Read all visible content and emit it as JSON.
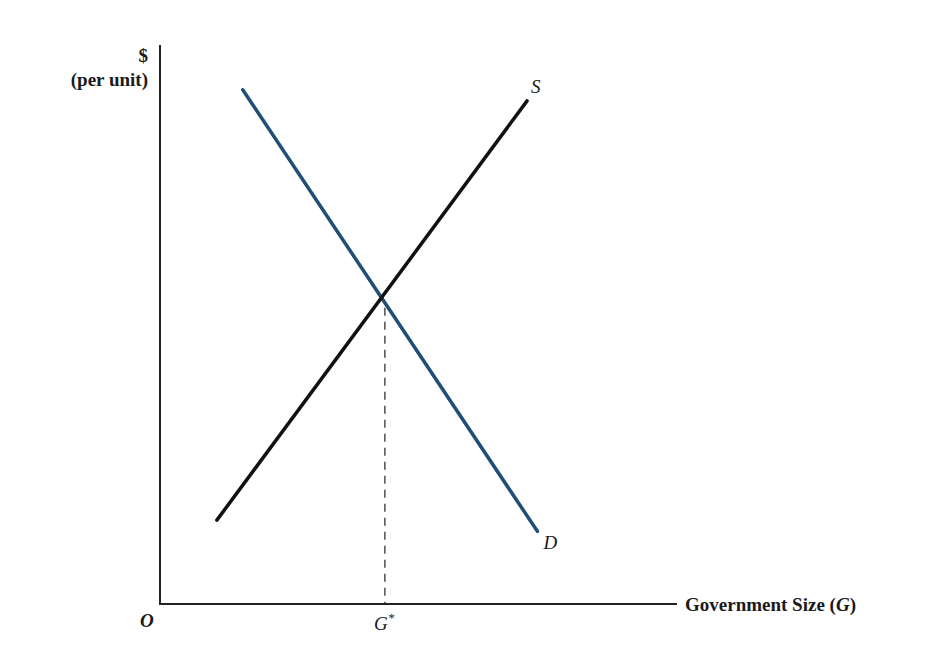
{
  "chart_data": {
    "type": "line",
    "title": "",
    "ylabel_line1": "$",
    "ylabel_line2": "(per unit)",
    "xlabel_prefix": "Government Size (",
    "xlabel_var": "G",
    "xlabel_suffix": ")",
    "origin_label": "O",
    "equilibrium_label": "G",
    "equilibrium_sup": "*",
    "grid": false,
    "xlim": [
      0,
      10
    ],
    "ylim": [
      0,
      10
    ],
    "series": [
      {
        "name": "D",
        "label": "D",
        "color": "#1f4e79",
        "points": [
          [
            1.6,
            9.2
          ],
          [
            7.3,
            1.3
          ]
        ]
      },
      {
        "name": "S",
        "label": "S",
        "color": "#111111",
        "points": [
          [
            1.1,
            1.5
          ],
          [
            7.1,
            9.0
          ]
        ]
      }
    ],
    "equilibrium": {
      "x": 4.35,
      "y": 5.3
    }
  }
}
